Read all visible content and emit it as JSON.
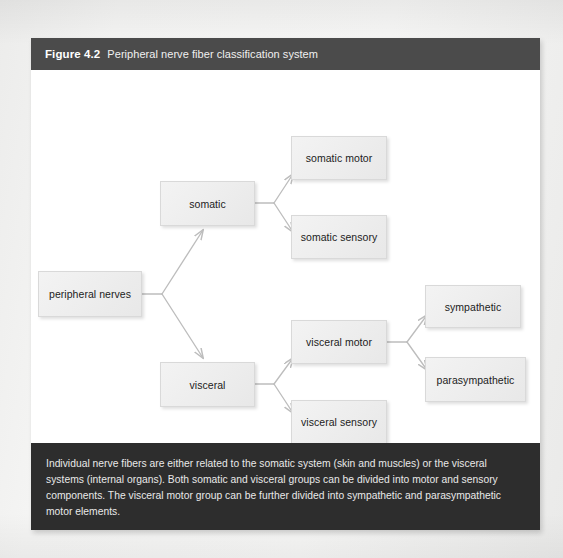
{
  "figure": {
    "number": "Figure 4.2",
    "title": "Peripheral nerve fiber classification system",
    "caption": "Individual nerve fibers are either related to the somatic system (skin and muscles) or the visceral systems (internal organs). Both somatic and visceral groups can be divided into motor and sensory components. The visceral motor group can be further divided into sympathetic and parasympathetic motor elements."
  },
  "colors": {
    "header_bar": "#4b4b4b",
    "caption_bar": "#2d2d2d",
    "node_fill": "#eeeeee",
    "node_border": "#d9d9d9",
    "connector": "#bdbdbd",
    "page_background": "#f2f2f0",
    "canvas": "#ffffff"
  },
  "diagram": {
    "type": "tree",
    "orientation": "left-to-right",
    "nodes": [
      {
        "id": "peripheral-nerves",
        "label": "peripheral nerves",
        "level": 0,
        "x": 7,
        "y": 201,
        "w": 104,
        "h": 46
      },
      {
        "id": "somatic",
        "label": "somatic",
        "level": 1,
        "x": 129,
        "y": 111,
        "w": 95,
        "h": 45
      },
      {
        "id": "visceral",
        "label": "visceral",
        "level": 1,
        "x": 129,
        "y": 292,
        "w": 95,
        "h": 45
      },
      {
        "id": "somatic-motor",
        "label": "somatic motor",
        "level": 2,
        "x": 260,
        "y": 66,
        "w": 96,
        "h": 44
      },
      {
        "id": "somatic-sensory",
        "label": "somatic sensory",
        "level": 2,
        "x": 260,
        "y": 145,
        "w": 96,
        "h": 44
      },
      {
        "id": "visceral-motor",
        "label": "visceral motor",
        "level": 2,
        "x": 260,
        "y": 250,
        "w": 96,
        "h": 44
      },
      {
        "id": "visceral-sensory",
        "label": "visceral sensory",
        "level": 2,
        "x": 260,
        "y": 330,
        "w": 96,
        "h": 44
      },
      {
        "id": "sympathetic",
        "label": "sympathetic",
        "level": 3,
        "x": 394,
        "y": 215,
        "w": 96,
        "h": 43
      },
      {
        "id": "parasympathetic",
        "label": "parasympathetic",
        "level": 3,
        "x": 394,
        "y": 287,
        "w": 101,
        "h": 45
      }
    ],
    "edges": [
      {
        "from": "peripheral-nerves",
        "to": "somatic"
      },
      {
        "from": "peripheral-nerves",
        "to": "visceral"
      },
      {
        "from": "somatic",
        "to": "somatic-motor"
      },
      {
        "from": "somatic",
        "to": "somatic-sensory"
      },
      {
        "from": "visceral",
        "to": "visceral-motor"
      },
      {
        "from": "visceral",
        "to": "visceral-sensory"
      },
      {
        "from": "visceral-motor",
        "to": "sympathetic"
      },
      {
        "from": "visceral-motor",
        "to": "parasympathetic"
      }
    ]
  }
}
